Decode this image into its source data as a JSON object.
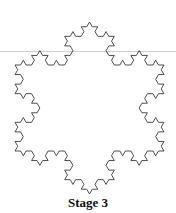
{
  "figure": {
    "caption": "Stage 3",
    "fractal": "koch-snowflake",
    "stage": 3,
    "center": [
      89.5,
      108
    ],
    "radius": 86,
    "stroke_color": "#3a3a3a",
    "rule_color": "#cfcfcf"
  }
}
